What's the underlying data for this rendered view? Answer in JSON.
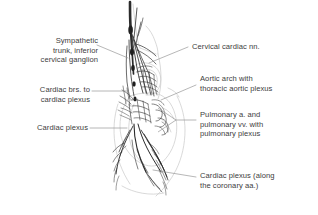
{
  "figure": {
    "type": "anatomical-illustration",
    "background_color": "#ffffff",
    "nerve_color": "#2b2b2b",
    "organ_outline_color": "#c9c9c9",
    "leader_line_color": "#8a8a8a",
    "text_color": "#3d3d3d"
  },
  "labels": {
    "sympathetic_trunk": {
      "text": "Sympathetic\ntrunk, inferior\ncervical ganglion",
      "side": "left",
      "x": 16,
      "y": 38
    },
    "cardiac_branches": {
      "text": "Cardiac brs. to\ncardiac plexus",
      "side": "left",
      "x": 16,
      "y": 85
    },
    "cardiac_plexus_left": {
      "text": "Cardiac plexus",
      "side": "left",
      "x": 16,
      "y": 124
    },
    "cervical_cardiac_nn": {
      "text": "Cervical cardiac nn.",
      "side": "right",
      "x": 192,
      "y": 44
    },
    "aortic_arch": {
      "text": "Aortic arch with\nthoracic aortic plexus",
      "side": "right",
      "x": 200,
      "y": 75
    },
    "pulmonary": {
      "text": "Pulmonary a. and\npulmonary vv. with\npulmonary plexus",
      "side": "right",
      "x": 200,
      "y": 112
    },
    "cardiac_plexus_coronary": {
      "text": "Cardiac plexus (along\nthe coronary aa.)",
      "side": "right",
      "x": 200,
      "y": 172
    }
  }
}
